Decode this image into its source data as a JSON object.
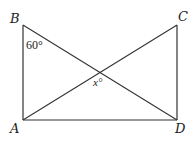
{
  "diagram": {
    "title": "",
    "points": {
      "A": {
        "label": "A",
        "x": 23,
        "y": 120
      },
      "B": {
        "label": "B",
        "x": 23,
        "y": 25
      },
      "C": {
        "label": "C",
        "x": 177,
        "y": 25
      },
      "D": {
        "label": "D",
        "x": 177,
        "y": 120
      }
    },
    "segments": [
      "AB",
      "AD",
      "CD",
      "BD",
      "AC"
    ],
    "angles": {
      "at_B": "60°",
      "at_intersection": "x°"
    },
    "colors": {
      "line": "#333333",
      "text": "#222222",
      "background": "#ffffff"
    }
  }
}
